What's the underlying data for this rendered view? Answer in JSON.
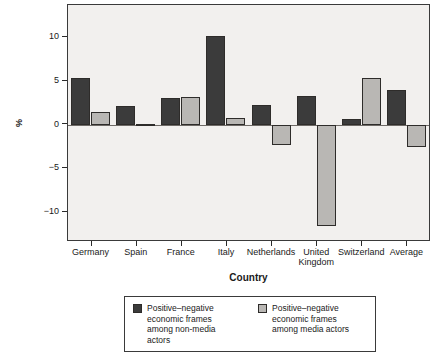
{
  "chart_data": {
    "type": "bar",
    "title": "",
    "subtitle": "",
    "xlabel": "Country",
    "ylabel": "%",
    "categories": [
      "Germany",
      "Spain",
      "France",
      "Italy",
      "Netherlands",
      "United Kingdom",
      "Switzerland",
      "Average"
    ],
    "category_lines": [
      [
        "Germany"
      ],
      [
        "Spain"
      ],
      [
        "France"
      ],
      [
        "Italy"
      ],
      [
        "Netherlands"
      ],
      [
        "United",
        "Kingdom"
      ],
      [
        "Switzerland"
      ],
      [
        "Average"
      ]
    ],
    "series": [
      {
        "name": "Positive–negative economic frames among non-media actors",
        "name_lines": [
          "Positive–negative",
          "economic frames",
          "among non-media",
          "actors"
        ],
        "color": "#3b3b3b",
        "values": [
          5.4,
          2.1,
          3.1,
          10.2,
          2.3,
          3.3,
          0.6,
          4.0
        ]
      },
      {
        "name": "Positive–negative economic frames among media actors",
        "name_lines": [
          "Positive–negative",
          "economic frames",
          "among media actors"
        ],
        "color": "#b9b7b4",
        "values": [
          1.4,
          0.0,
          3.2,
          0.8,
          -2.3,
          -11.6,
          5.3,
          -2.6
        ]
      }
    ],
    "ylim": [
      -13.2,
      13.7
    ],
    "yticks": [
      10,
      5,
      0,
      -5,
      -10
    ],
    "ytick_labels": [
      "10",
      "5",
      "0",
      "−5",
      "−10"
    ],
    "grid": false,
    "legend_position": "bottom",
    "zero_line": 0,
    "plot_background": "#f2f0ee",
    "frame_color": "#3a3a3a"
  }
}
